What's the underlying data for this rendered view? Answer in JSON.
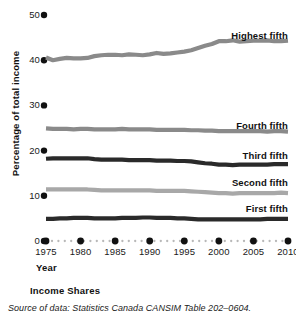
{
  "chart_data": {
    "type": "line",
    "title": "Income Shares",
    "xlabel": "Year",
    "ylabel": "Percentage of total income",
    "xlim": [
      1975,
      2010
    ],
    "ylim": [
      0,
      50
    ],
    "yticks": [
      0,
      10,
      20,
      30,
      40,
      50
    ],
    "ytick_labels": [
      "0",
      "10",
      "20",
      "30",
      "40",
      "50"
    ],
    "xticks": [
      1975,
      1980,
      1985,
      1990,
      1995,
      2000,
      2005,
      2010
    ],
    "xtick_labels": [
      "1975",
      "1980",
      "1985",
      "1990",
      "1995",
      "2000",
      "2005",
      "2010"
    ],
    "grid": false,
    "legend_position": "inline-right",
    "x": [
      1975,
      1976,
      1977,
      1978,
      1979,
      1980,
      1981,
      1982,
      1983,
      1984,
      1985,
      1986,
      1987,
      1988,
      1989,
      1990,
      1991,
      1992,
      1993,
      1994,
      1995,
      1996,
      1997,
      1998,
      1999,
      2000,
      2001,
      2002,
      2003,
      2004,
      2005,
      2006,
      2007,
      2008,
      2009,
      2010
    ],
    "series": [
      {
        "name": "Highest fifth",
        "color": "#8a8a8a",
        "label_y": 30,
        "values": [
          40.6,
          40.0,
          40.3,
          40.5,
          40.4,
          40.4,
          40.5,
          40.9,
          41.1,
          41.2,
          41.2,
          41.1,
          41.3,
          41.2,
          41.1,
          41.3,
          41.6,
          41.4,
          41.5,
          41.7,
          41.9,
          42.2,
          42.7,
          43.2,
          43.6,
          44.2,
          44.2,
          44.4,
          44.1,
          44.2,
          44.3,
          44.3,
          44.4,
          44.2,
          44.2,
          44.3
        ]
      },
      {
        "name": "Fourth fifth",
        "color": "#8a8a8a",
        "label_y": 120,
        "values": [
          24.9,
          24.8,
          24.8,
          24.8,
          24.7,
          24.8,
          24.8,
          24.7,
          24.7,
          24.7,
          24.7,
          24.8,
          24.7,
          24.7,
          24.7,
          24.7,
          24.6,
          24.6,
          24.6,
          24.6,
          24.6,
          24.5,
          24.5,
          24.4,
          24.4,
          24.3,
          24.3,
          24.3,
          24.3,
          24.3,
          24.3,
          24.3,
          24.2,
          24.3,
          24.3,
          24.2
        ]
      },
      {
        "name": "Third fifth",
        "color": "#2a2a2a",
        "label_y": 150,
        "values": [
          18.2,
          18.3,
          18.3,
          18.3,
          18.3,
          18.3,
          18.3,
          18.1,
          18.0,
          18.0,
          18.0,
          18.0,
          17.9,
          17.9,
          17.9,
          17.9,
          17.8,
          17.8,
          17.8,
          17.7,
          17.7,
          17.6,
          17.4,
          17.2,
          17.1,
          16.9,
          16.9,
          16.8,
          16.9,
          16.9,
          16.9,
          16.9,
          16.9,
          17.0,
          17.0,
          17.0
        ]
      },
      {
        "name": "Second fifth",
        "color": "#a8a8a8",
        "label_y": 177,
        "values": [
          11.4,
          11.4,
          11.4,
          11.4,
          11.4,
          11.4,
          11.4,
          11.3,
          11.2,
          11.2,
          11.2,
          11.2,
          11.2,
          11.2,
          11.2,
          11.2,
          11.1,
          11.1,
          11.1,
          11.1,
          11.1,
          11.0,
          10.9,
          10.8,
          10.7,
          10.6,
          10.6,
          10.5,
          10.6,
          10.6,
          10.6,
          10.6,
          10.6,
          10.6,
          10.7,
          10.6
        ]
      },
      {
        "name": "First fifth",
        "color": "#2a2a2a",
        "label_y": 203,
        "values": [
          4.9,
          4.9,
          5.0,
          5.0,
          5.1,
          5.1,
          5.1,
          5.0,
          5.0,
          5.0,
          5.0,
          5.1,
          5.1,
          5.1,
          5.2,
          5.2,
          5.1,
          5.1,
          5.1,
          5.0,
          5.0,
          4.9,
          4.8,
          4.8,
          4.8,
          4.8,
          4.8,
          4.8,
          4.8,
          4.8,
          4.8,
          4.8,
          4.9,
          4.9,
          4.9,
          4.9
        ]
      }
    ]
  },
  "caption": {
    "title": "Income Shares",
    "source": "Source of data: Statistics Canada CANSIM Table 202–0604."
  }
}
